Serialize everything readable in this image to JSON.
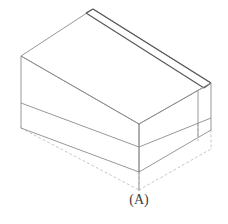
{
  "figure": {
    "background_color": "#ffffff",
    "line_color": "#8c8c8c",
    "tape_line_color": "#595959",
    "hidden_line_color": "#bfbfbf",
    "label_color": "#404040"
  },
  "callout": {
    "label": "(A)",
    "target_description": "front bottom corner of carton",
    "leader": {
      "from_x": 139,
      "from_y": 172,
      "to_x": 139,
      "to_y": 190
    }
  },
  "geometry": {
    "units": "pixels",
    "view": "isometric",
    "vertices": {
      "top_rear": [
        93,
        9
      ],
      "top_left": [
        21,
        56
      ],
      "top_front": [
        139,
        124
      ],
      "top_right": [
        211,
        83
      ],
      "bottom_left": [
        21,
        128
      ],
      "bottom_front": [
        139,
        172
      ],
      "bottom_right": [
        211,
        130
      ],
      "hidden_rear_bottom": [
        93,
        81
      ]
    },
    "band_line_y": {
      "left_edge": 103,
      "front_corner": 147,
      "right_edge": 118
    },
    "tape_strip": {
      "offset_px": 9,
      "from": [
        93,
        9
      ],
      "to": [
        211,
        83
      ]
    },
    "side_seam_x": 198
  },
  "styles": {
    "solid_stroke_width": 0.9,
    "tape_stroke_width": 1.3,
    "dash_pattern": "2 3"
  }
}
